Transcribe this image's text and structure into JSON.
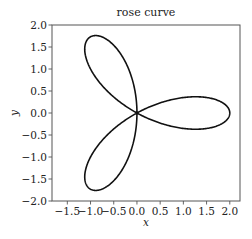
{
  "chart_data": {
    "type": "line",
    "title": "rose curve",
    "xlabel": "x",
    "ylabel": "y",
    "equation": "r = 2cos(3θ)",
    "parametric": {
      "a": 2,
      "k": 3,
      "theta_range": [
        0,
        3.14159265
      ]
    },
    "xlim": [
      -1.83,
      2.22
    ],
    "ylim": [
      -2.0,
      2.0
    ],
    "xticks": [
      -1.5,
      -1.0,
      -0.5,
      0.0,
      0.5,
      1.0,
      1.5,
      2.0
    ],
    "xtick_labels": [
      "−1.5",
      "−1.0",
      "−0.5",
      "0.0",
      "0.5",
      "1.0",
      "1.5",
      "2.0"
    ],
    "yticks": [
      -2.0,
      -1.5,
      -1.0,
      -0.5,
      0.0,
      0.5,
      1.0,
      1.5,
      2.0
    ],
    "ytick_labels": [
      "−2.0",
      "−1.5",
      "−1.0",
      "−0.5",
      "0.0",
      "0.5",
      "1.0",
      "1.5",
      "2.0"
    ],
    "grid": false,
    "legend": null,
    "line_color": "#111111",
    "petals": [
      {
        "angle_deg": 0,
        "tip": [
          2.0,
          0.0
        ]
      },
      {
        "angle_deg": 120,
        "tip": [
          -1.0,
          1.73
        ]
      },
      {
        "angle_deg": 240,
        "tip": [
          -1.0,
          -1.73
        ]
      }
    ]
  }
}
